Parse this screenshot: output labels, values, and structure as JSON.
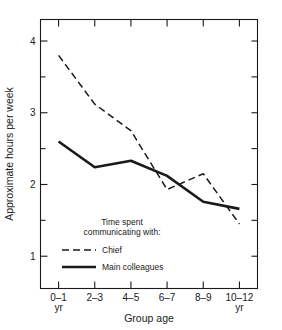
{
  "chart_data": {
    "type": "line",
    "title": "",
    "xlabel": "Group age",
    "ylabel": "Approximate hours per week",
    "categories": [
      "0–1\nyr",
      "2–3",
      "4–5",
      "6–7",
      "8–9",
      "10–12\nyr"
    ],
    "category_labels": [
      {
        "main": "0–1",
        "sub": "yr"
      },
      {
        "main": "2–3",
        "sub": ""
      },
      {
        "main": "4–5",
        "sub": ""
      },
      {
        "main": "6–7",
        "sub": ""
      },
      {
        "main": "8–9",
        "sub": ""
      },
      {
        "main": "10–12",
        "sub": "yr"
      }
    ],
    "ylim": [
      0.55,
      4.3
    ],
    "y_major_ticks": [
      1,
      2,
      3,
      4
    ],
    "y_minor_ticks": [
      1.5,
      2.5,
      3.5
    ],
    "y_tick_labels": [
      "1",
      "2",
      "3",
      "4"
    ],
    "grid": false,
    "legend_position": "inside-lower-left",
    "legend_title_line1": "Time spent",
    "legend_title_line2": "communicating with:",
    "series": [
      {
        "name": "Chief",
        "style": "dashed",
        "color": "#1a1a1a",
        "values": [
          3.8,
          3.12,
          2.75,
          1.93,
          2.15,
          1.45
        ]
      },
      {
        "name": "Main colleagues",
        "style": "solid",
        "color": "#1a1a1a",
        "values": [
          2.6,
          2.24,
          2.33,
          2.12,
          1.76,
          1.66
        ]
      }
    ]
  },
  "axes": {
    "frame_color": "#1a1a1a"
  }
}
